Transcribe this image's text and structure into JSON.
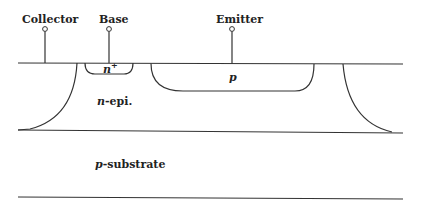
{
  "diagram": {
    "title": "",
    "terminals": [
      {
        "label": "Collector",
        "x": 45
      },
      {
        "label": "Base",
        "x": 109
      },
      {
        "label": "Emitter",
        "x": 232
      }
    ],
    "regions": {
      "n_plus": {
        "label_main": "n",
        "label_sup": "+"
      },
      "p_emitter": {
        "label": "p"
      },
      "n_epi": {
        "label_italic": "n",
        "label_rest": "-epi."
      },
      "p_substrate": {
        "label_italic": "p",
        "label_rest": "-substrate"
      }
    },
    "colors": {
      "line": "#333333",
      "text": "#222222",
      "background": "#ffffff"
    }
  }
}
